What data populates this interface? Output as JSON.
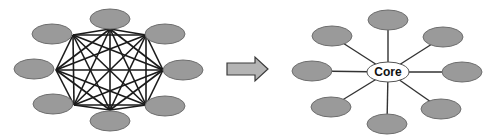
{
  "diagram": {
    "title": "",
    "left": {
      "name": "full-mesh-network",
      "node_count": 8,
      "node_fill": "#9a9a9a",
      "edge_color": "#1a1a1a",
      "nodes": [
        {
          "id": "n1",
          "cx": 110,
          "cy": 19,
          "vx": 110,
          "vy": 29
        },
        {
          "id": "n2",
          "cx": 165,
          "cy": 34,
          "vx": 146,
          "vy": 35
        },
        {
          "id": "n3",
          "cx": 183,
          "cy": 70,
          "vx": 163,
          "vy": 70
        },
        {
          "id": "n4",
          "cx": 165,
          "cy": 106,
          "vx": 146,
          "vy": 105
        },
        {
          "id": "n5",
          "cx": 110,
          "cy": 121,
          "vx": 110,
          "vy": 110
        },
        {
          "id": "n6",
          "cx": 53,
          "cy": 104,
          "vx": 74,
          "vy": 105
        },
        {
          "id": "n7",
          "cx": 34,
          "cy": 69,
          "vx": 56,
          "vy": 70
        },
        {
          "id": "n8",
          "cx": 52,
          "cy": 34,
          "vx": 73,
          "vy": 35
        }
      ]
    },
    "arrow": {
      "direction": "right",
      "fill": "#b4b4b4"
    },
    "right": {
      "name": "hub-and-spoke-network",
      "core_label": "Core",
      "core": {
        "cx": 388,
        "cy": 72,
        "rx": 21,
        "ry": 10
      },
      "node_fill": "#9a9a9a",
      "nodes": [
        {
          "id": "s1",
          "cx": 388,
          "cy": 20
        },
        {
          "id": "s2",
          "cx": 443,
          "cy": 37
        },
        {
          "id": "s3",
          "cx": 462,
          "cy": 72
        },
        {
          "id": "s4",
          "cx": 441,
          "cy": 109
        },
        {
          "id": "s5",
          "cx": 387,
          "cy": 124
        },
        {
          "id": "s6",
          "cx": 331,
          "cy": 107
        },
        {
          "id": "s7",
          "cx": 312,
          "cy": 71
        },
        {
          "id": "s8",
          "cx": 332,
          "cy": 36
        }
      ]
    }
  }
}
